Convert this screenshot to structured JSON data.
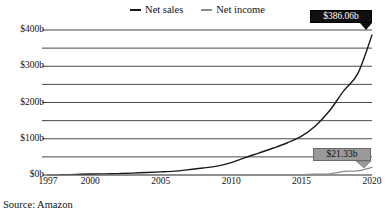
{
  "chart_data": {
    "type": "line",
    "title": "",
    "xlabel": "",
    "ylabel": "",
    "xlim": [
      1997,
      2020
    ],
    "ylim": [
      0,
      420
    ],
    "grid": true,
    "grid_interval": 50,
    "legend_position": "top-center",
    "x": [
      1997,
      1998,
      1999,
      2000,
      2001,
      2002,
      2003,
      2004,
      2005,
      2006,
      2007,
      2008,
      2009,
      2010,
      2011,
      2012,
      2013,
      2014,
      2015,
      2016,
      2017,
      2018,
      2019,
      2020
    ],
    "xtick_labels": [
      "1997",
      "2000",
      "2005",
      "2010",
      "2015",
      "2020"
    ],
    "xticks": [
      1997,
      2000,
      2005,
      2010,
      2015,
      2020
    ],
    "ytick_labels": [
      "$0b",
      "$100b",
      "$200b",
      "$300b",
      "$400b"
    ],
    "yticks": [
      0,
      100,
      200,
      300,
      400
    ],
    "series": [
      {
        "name": "Net sales",
        "color": "#1a1a1a",
        "values": [
          0.15,
          0.61,
          1.64,
          2.76,
          3.12,
          3.93,
          5.26,
          6.92,
          8.49,
          10.71,
          14.84,
          19.17,
          24.51,
          34.2,
          48.08,
          61.09,
          74.45,
          88.99,
          107.01,
          135.99,
          177.87,
          232.89,
          280.52,
          386.06
        ]
      },
      {
        "name": "Net income",
        "color": "#8c8c8c",
        "values": [
          -0.03,
          -0.12,
          -0.72,
          -1.41,
          -0.57,
          -0.15,
          0.04,
          0.59,
          0.36,
          0.19,
          0.48,
          0.65,
          0.9,
          1.15,
          0.63,
          -0.04,
          0.27,
          -0.24,
          0.6,
          2.37,
          3.03,
          10.07,
          11.59,
          21.33
        ]
      }
    ],
    "annotations": [
      {
        "id": "sales-end-label",
        "text": "$386.06b",
        "series": "Net sales",
        "x": 2020,
        "y": 386.06,
        "style": "dark"
      },
      {
        "id": "income-end-label",
        "text": "$21.33b",
        "series": "Net income",
        "x": 2020,
        "y": 21.33,
        "style": "gray"
      }
    ]
  },
  "legend": {
    "items": [
      {
        "label": "Net sales",
        "color": "#1a1a1a"
      },
      {
        "label": "Net income",
        "color": "#8c8c8c"
      }
    ]
  },
  "caption": {
    "source": "Source: Amazon"
  }
}
